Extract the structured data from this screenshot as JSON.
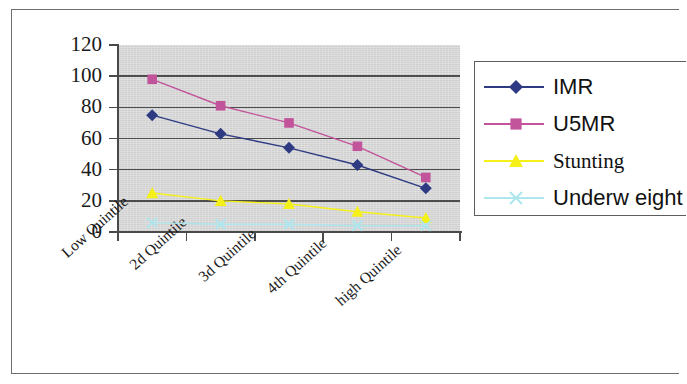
{
  "chart_data": {
    "type": "line",
    "title": "",
    "xlabel": "",
    "ylabel": "",
    "categories": [
      "Low Quintile",
      "2d Quintile",
      "3d Quintile",
      "4th Quintile",
      "high Quintile"
    ],
    "ylim": [
      0,
      120
    ],
    "yticks": [
      0,
      20,
      40,
      60,
      80,
      100,
      120
    ],
    "ytick_labels": [
      "0",
      "20",
      "40",
      "60",
      "80",
      "100",
      "120"
    ],
    "grid": true,
    "legend_position": "right",
    "plot_background": "#d6d6d6",
    "series": [
      {
        "name": "IMR",
        "values": [
          75,
          63,
          54,
          43,
          28
        ],
        "color": "#2e3b82",
        "marker": "diamond",
        "legend_label": "IMR"
      },
      {
        "name": "U5MR",
        "values": [
          98,
          81,
          70,
          55,
          35
        ],
        "color": "#c1549a",
        "marker": "square",
        "legend_label": "U5MR"
      },
      {
        "name": "Stunting",
        "values": [
          25,
          20,
          18,
          13,
          9
        ],
        "color": "#f5f018",
        "marker": "triangle",
        "legend_label": "Stunting"
      },
      {
        "name": "Underweight",
        "values": [
          6,
          5,
          5,
          4,
          4
        ],
        "color": "#aee6ee",
        "marker": "x",
        "legend_label": "Underw eight"
      }
    ]
  },
  "legend": {
    "items": [
      {
        "label": "IMR"
      },
      {
        "label": "U5MR"
      },
      {
        "label": "Stunting"
      },
      {
        "label": "Underw eight"
      }
    ]
  },
  "axes": {
    "y_tick_labels": [
      "120",
      "100",
      "80",
      "60",
      "40",
      "20",
      "0"
    ],
    "x_tick_labels": [
      "Low Quintile",
      "2d Quintile",
      "3d Quintile",
      "4th Quintile",
      "high Quintile"
    ]
  }
}
